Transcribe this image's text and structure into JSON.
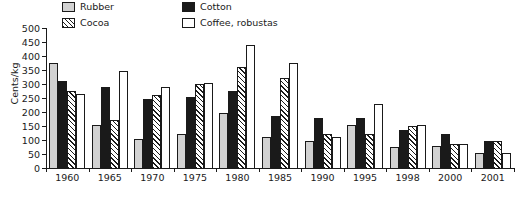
{
  "chart_data": {
    "type": "bar",
    "title": "",
    "xlabel": "",
    "ylabel": "Cents/kg",
    "ylim": [
      0,
      500
    ],
    "ytick_step": 50,
    "yticks": [
      500,
      450,
      400,
      350,
      300,
      250,
      200,
      150,
      100,
      50,
      0
    ],
    "grid": false,
    "legend_position": "top-left-inside",
    "categories": [
      "1960",
      "1965",
      "1970",
      "1975",
      "1980",
      "1985",
      "1990",
      "1995",
      "1998",
      "2000",
      "2001"
    ],
    "series": [
      {
        "name": "Rubber",
        "color": "#d2d2d2",
        "pattern": "solid-light-gray",
        "values": [
          375,
          155,
          105,
          120,
          195,
          110,
          95,
          155,
          75,
          80,
          55
        ]
      },
      {
        "name": "Cotton",
        "color": "#1a1a1a",
        "pattern": "solid-black",
        "values": [
          310,
          290,
          245,
          255,
          275,
          185,
          180,
          180,
          135,
          120,
          95
        ]
      },
      {
        "name": "Cocoa",
        "color": "#1a1a1a",
        "pattern": "diagonal-hatch",
        "values": [
          275,
          170,
          260,
          300,
          360,
          320,
          120,
          120,
          150,
          85,
          95
        ]
      },
      {
        "name": "Coffee, robustas",
        "color": "#ffffff",
        "pattern": "outline-white",
        "values": [
          265,
          345,
          290,
          305,
          440,
          375,
          110,
          230,
          155,
          85,
          55
        ]
      }
    ]
  },
  "legend": {
    "items": [
      {
        "label": "Rubber",
        "swatch": "rubber"
      },
      {
        "label": "Cotton",
        "swatch": "cotton"
      },
      {
        "label": "Cocoa",
        "swatch": "cocoa"
      },
      {
        "label": "Coffee, robustas",
        "swatch": "coffee"
      }
    ]
  }
}
